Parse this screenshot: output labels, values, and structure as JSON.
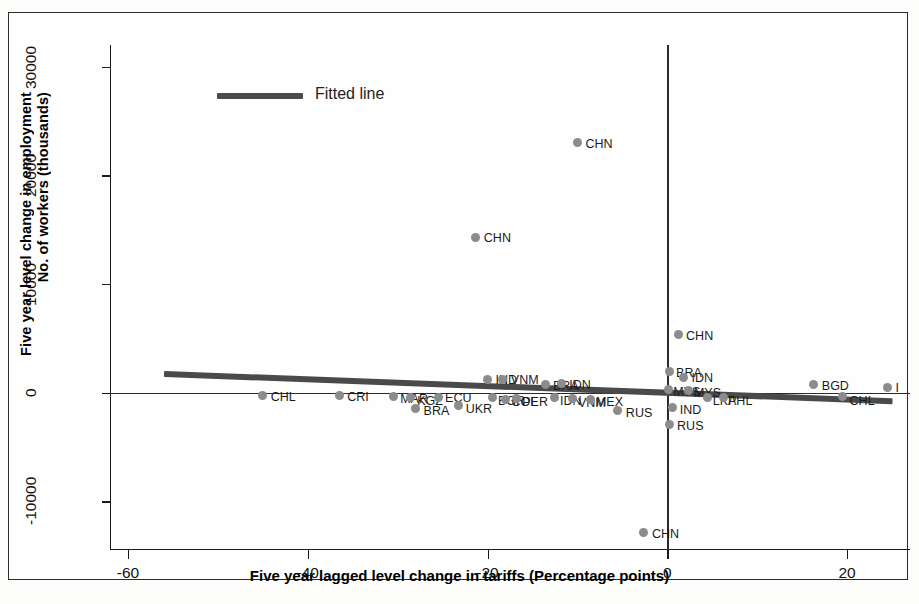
{
  "chart_data": {
    "type": "scatter",
    "title": "",
    "xlabel": "Five year lagged level change in tariffs (Percentage points)",
    "ylabel_line1": "Five year level change in employment",
    "ylabel_line2": "No. of workers (thousands)",
    "xlim": [
      -62,
      27
    ],
    "ylim": [
      -14500,
      32000
    ],
    "xticks": [
      -60,
      -40,
      -20,
      0,
      20
    ],
    "xtick_labels": [
      "-60",
      "-40",
      "-20",
      "0",
      "20"
    ],
    "yticks": [
      -10000,
      0,
      10000,
      20000,
      30000
    ],
    "ytick_labels": [
      "-10000",
      "0",
      "10000",
      "20000",
      "30000"
    ],
    "grid": false,
    "reference_lines": {
      "vertical_x": 0,
      "horizontal_y": 0
    },
    "legend": {
      "position": "top-left",
      "entries": [
        "Fitted line"
      ]
    },
    "marker_color": "#8c8c8c",
    "fit_line_color": "#4a4a4a",
    "fit_line": {
      "x1": -56,
      "y1": 1700,
      "x2": 25,
      "y2": -800
    },
    "points": [
      {
        "label": "CHN",
        "x": -10.0,
        "y": 23000,
        "lx": 8,
        "ly": -6
      },
      {
        "label": "CHN",
        "x": -21.3,
        "y": 14300,
        "lx": 8,
        "ly": -6
      },
      {
        "label": "CHN",
        "x": 1.2,
        "y": 5300,
        "lx": 8,
        "ly": -6
      },
      {
        "label": "CHN",
        "x": -2.6,
        "y": -12900,
        "lx": 8,
        "ly": -6
      },
      {
        "label": "CHL",
        "x": -45.0,
        "y": -300,
        "lx": 8,
        "ly": -6
      },
      {
        "label": "CRI",
        "x": -36.5,
        "y": -300,
        "lx": 8,
        "ly": -6
      },
      {
        "label": "MAR",
        "x": -30.5,
        "y": -400,
        "lx": 7,
        "ly": -5
      },
      {
        "label": "KGZ",
        "x": -28.6,
        "y": -500,
        "lx": 7,
        "ly": -4
      },
      {
        "label": "BRA",
        "x": -28.0,
        "y": -1500,
        "lx": 8,
        "ly": -5
      },
      {
        "label": "ECU",
        "x": -25.5,
        "y": -450,
        "lx": 7,
        "ly": -6
      },
      {
        "label": "UKR",
        "x": -23.2,
        "y": -1200,
        "lx": 7,
        "ly": -4
      },
      {
        "label": "IND",
        "x": -20.0,
        "y": 1200,
        "lx": 8,
        "ly": -6
      },
      {
        "label": "VNM",
        "x": -18.3,
        "y": 1200,
        "lx": 8,
        "ly": -6
      },
      {
        "label": "BGR",
        "x": -19.5,
        "y": -500,
        "lx": 6,
        "ly": -4
      },
      {
        "label": "COL",
        "x": -18.0,
        "y": -600,
        "lx": 6,
        "ly": -4
      },
      {
        "label": "PER",
        "x": -16.8,
        "y": -550,
        "lx": 6,
        "ly": -4
      },
      {
        "label": "BRA",
        "x": -13.5,
        "y": 700,
        "lx": 7,
        "ly": -6
      },
      {
        "label": "IDN",
        "x": -11.8,
        "y": 800,
        "lx": 8,
        "ly": -6
      },
      {
        "label": "IDN",
        "x": -12.6,
        "y": -500,
        "lx": 6,
        "ly": -4
      },
      {
        "label": "VNM",
        "x": -10.5,
        "y": -550,
        "lx": 5,
        "ly": -3
      },
      {
        "label": "MEX",
        "x": -8.5,
        "y": -600,
        "lx": 5,
        "ly": -4
      },
      {
        "label": "RUS",
        "x": -5.5,
        "y": -1700,
        "lx": 8,
        "ly": -5
      },
      {
        "label": "BRA",
        "x": 0.2,
        "y": 1900,
        "lx": 7,
        "ly": -6
      },
      {
        "label": "IDN",
        "x": 1.8,
        "y": 1400,
        "lx": 8,
        "ly": -6
      },
      {
        "label": "MYS",
        "x": 0.1,
        "y": 300,
        "lx": 5,
        "ly": -4
      },
      {
        "label": "MYS",
        "x": 2.4,
        "y": 200,
        "lx": 5,
        "ly": -4
      },
      {
        "label": "IND",
        "x": 0.6,
        "y": -1400,
        "lx": 7,
        "ly": -5
      },
      {
        "label": "RUS",
        "x": 0.2,
        "y": -2900,
        "lx": 8,
        "ly": -5
      },
      {
        "label": "LKA",
        "x": 4.5,
        "y": -500,
        "lx": 5,
        "ly": -4
      },
      {
        "label": "PHL",
        "x": 6.2,
        "y": -500,
        "lx": 5,
        "ly": -4
      },
      {
        "label": "BGD",
        "x": 16.3,
        "y": 700,
        "lx": 8,
        "ly": -6
      },
      {
        "label": "CHL",
        "x": 19.5,
        "y": -400,
        "lx": 7,
        "ly": -3
      },
      {
        "label": "I",
        "x": 24.5,
        "y": 500,
        "lx": 8,
        "ly": -6
      }
    ],
    "cluster_note": "dense overlapping band of country labels along y=0"
  }
}
